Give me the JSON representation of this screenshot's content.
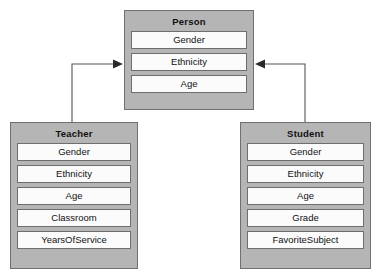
{
  "diagram": {
    "type": "uml-class-inheritance",
    "background_color": "#ffffff",
    "box_fill_color": "#b5b5b5",
    "box_border_color": "#707070",
    "attribute_fill_color": "#fbfbfb",
    "attribute_border_color": "#6e6e6e",
    "connector_color": "#555555",
    "classes": [
      {
        "id": "person",
        "title": "Person",
        "attributes": [
          "Gender",
          "Ethnicity",
          "Age"
        ]
      },
      {
        "id": "teacher",
        "title": "Teacher",
        "attributes": [
          "Gender",
          "Ethnicity",
          "Age",
          "Classroom",
          "YearsOfService"
        ]
      },
      {
        "id": "student",
        "title": "Student",
        "attributes": [
          "Gender",
          "Ethnicity",
          "Age",
          "Grade",
          "FavoriteSubject"
        ]
      }
    ],
    "connectors": [
      {
        "id": "teacher-to-person",
        "from": "teacher",
        "to": "person",
        "relationship": "generalization",
        "arrow_direction": "right"
      },
      {
        "id": "student-to-person",
        "from": "student",
        "to": "person",
        "relationship": "generalization",
        "arrow_direction": "left"
      }
    ]
  }
}
